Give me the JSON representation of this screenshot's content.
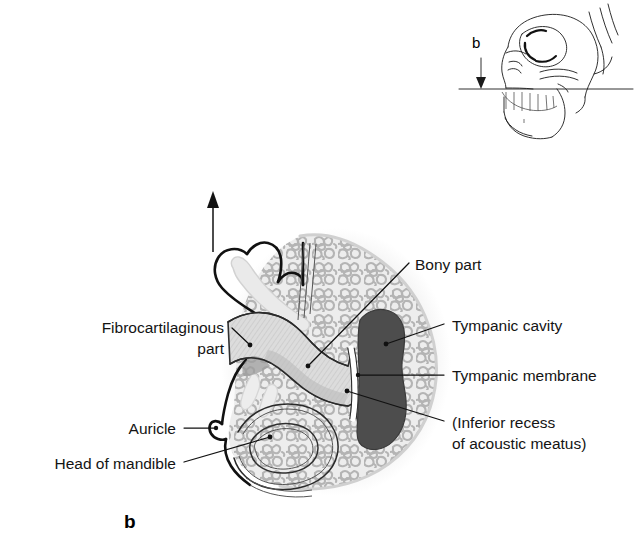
{
  "figure": {
    "panel_letter": "b",
    "title_absent": true,
    "background_color": "#ffffff",
    "ink_color": "#141414"
  },
  "inset": {
    "name": "lateral-skull-orientation-inset",
    "letter": "b",
    "arrow_direction": "down",
    "section_line": "horizontal",
    "description_absent": true
  },
  "main": {
    "orientation_arrow": {
      "direction": "up",
      "x": 213,
      "y_top": 193,
      "y_bottom": 252
    }
  },
  "colors": {
    "cancellous_bone": "#e3e3e3",
    "cancellous_speckle": "#b9b9b9",
    "tympanic_cavity": "#4d4d4d",
    "meatus_hatch": "#cfcfcf",
    "meatus_fill": "#d7d7d7",
    "cartilage_light": "#e9e9e9",
    "membrane_white": "#ffffff",
    "outline": "#111111"
  },
  "labels": [
    {
      "id": "fibrocartilaginous-part",
      "lines": [
        "Fibrocartilaginous",
        "part"
      ],
      "align": "right",
      "text_x": 224,
      "text_y": 333,
      "line_height": 21,
      "leader": [
        [
          232,
          329
        ],
        [
          248,
          345
        ]
      ],
      "dot": [
        248,
        345
      ]
    },
    {
      "id": "auricle",
      "lines": [
        "Auricle"
      ],
      "align": "right",
      "text_x": 176,
      "text_y": 433,
      "line_height": 21,
      "leader": [
        [
          184,
          428
        ],
        [
          215,
          428
        ]
      ],
      "dot": [
        215,
        428
      ]
    },
    {
      "id": "head-of-mandible",
      "lines": [
        "Head of mandible"
      ],
      "align": "right",
      "text_x": 176,
      "text_y": 468,
      "line_height": 21,
      "leader": [
        [
          184,
          463
        ],
        [
          268,
          437
        ]
      ],
      "dot": [
        268,
        437
      ]
    },
    {
      "id": "bony-part",
      "lines": [
        "Bony part"
      ],
      "align": "left",
      "text_x": 415,
      "text_y": 270,
      "line_height": 21,
      "leader": [
        [
          408,
          264
        ],
        [
          308,
          366
        ]
      ],
      "dot": [
        308,
        366
      ]
    },
    {
      "id": "tympanic-cavity",
      "lines": [
        "Tympanic cavity"
      ],
      "align": "left",
      "text_x": 452,
      "text_y": 331,
      "line_height": 21,
      "leader": [
        [
          444,
          325
        ],
        [
          386,
          345
        ]
      ],
      "dot": [
        386,
        345
      ]
    },
    {
      "id": "tympanic-membrane",
      "lines": [
        "Tympanic membrane"
      ],
      "align": "left",
      "text_x": 452,
      "text_y": 381,
      "line_height": 21,
      "leader": [
        [
          444,
          375
        ],
        [
          360,
          375
        ]
      ],
      "dot": [
        360,
        375
      ]
    },
    {
      "id": "inferior-recess-of-acoustic-meatus",
      "lines": [
        "(Inferior recess",
        "of acoustic meatus)"
      ],
      "align": "left",
      "text_x": 452,
      "text_y": 428,
      "line_height": 21,
      "leader": [
        [
          444,
          422
        ],
        [
          346,
          392
        ]
      ],
      "dot": [
        346,
        392
      ]
    }
  ]
}
